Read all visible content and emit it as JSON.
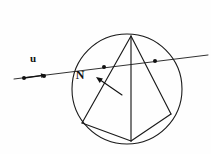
{
  "figure": {
    "kind": "geometry-diagram",
    "caption": "",
    "background_color": "#fefefe",
    "stroke_color": "#1a1a1a",
    "width": 211,
    "height": 154
  },
  "labels": {
    "u": "u",
    "N": "N"
  },
  "chart_data": {
    "type": "scatter",
    "title": "",
    "xlabel": "",
    "ylabel": "",
    "xlim": [
      0,
      211
    ],
    "ylim": [
      154,
      0
    ],
    "grid": false,
    "legend": null,
    "elements": {
      "circle": {
        "center": [
          127,
          89
        ],
        "radius": 55,
        "stroke": "#1a1a1a",
        "stroke_width": 1.1,
        "fill": "none"
      },
      "polygon_vertices": {
        "top": [
          131,
          36
        ],
        "left": [
          82,
          123
        ],
        "bottom": [
          131,
          141
        ],
        "right": [
          171,
          114
        ]
      },
      "polygon_edges": [
        {
          "name": "top-to-left",
          "from": [
            131,
            36
          ],
          "to": [
            82,
            123
          ]
        },
        {
          "name": "left-to-bottom",
          "from": [
            82,
            123
          ],
          "to": [
            131,
            141
          ]
        },
        {
          "name": "bottom-to-right",
          "from": [
            131,
            141
          ],
          "to": [
            171,
            114
          ]
        },
        {
          "name": "right-to-top",
          "from": [
            171,
            114
          ],
          "to": [
            131,
            36
          ]
        },
        {
          "name": "top-to-bottom-chord",
          "from": [
            131,
            36
          ],
          "to": [
            131,
            141
          ]
        }
      ],
      "transversal_line": {
        "from": [
          14,
          79
        ],
        "to": [
          208,
          55
        ],
        "stroke_width": 0.9
      },
      "transversal_points": [
        {
          "x": 24,
          "y": 78,
          "r": 2.0
        },
        {
          "x": 44,
          "y": 76,
          "r": 2.0
        },
        {
          "x": 104,
          "y": 67,
          "r": 2.0
        },
        {
          "x": 155,
          "y": 61,
          "r": 2.0
        }
      ],
      "u_arrow": {
        "from": [
          24,
          78
        ],
        "to": [
          46,
          75
        ],
        "label_position": [
          33,
          62
        ]
      },
      "n_arrow": {
        "from": [
          122,
          95
        ],
        "to": [
          96,
          77
        ],
        "label_position": [
          80,
          79
        ]
      }
    }
  }
}
